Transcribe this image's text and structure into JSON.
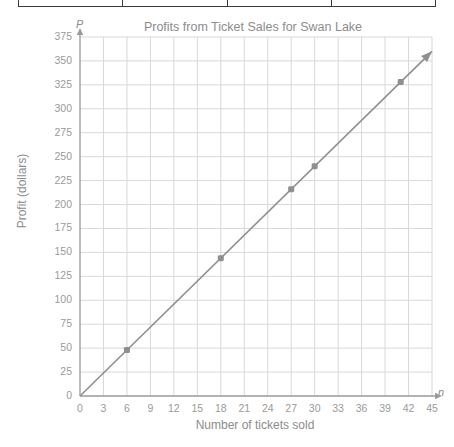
{
  "table_strip": {
    "cells": [
      "",
      "",
      "",
      ""
    ]
  },
  "chart_data": {
    "type": "line",
    "title": "Profits from Ticket Sales for Swan Lake",
    "xlabel": "Number of tickets sold",
    "ylabel": "Profit (dollars)",
    "x_variable": "n",
    "y_variable": "P",
    "xlim": [
      0,
      45
    ],
    "ylim": [
      0,
      375
    ],
    "xticks": [
      0,
      3,
      6,
      9,
      12,
      15,
      18,
      21,
      24,
      27,
      30,
      33,
      36,
      39,
      42,
      45
    ],
    "yticks": [
      0,
      25,
      50,
      75,
      100,
      125,
      150,
      175,
      200,
      225,
      250,
      275,
      300,
      325,
      350,
      375
    ],
    "grid": true,
    "legend": null,
    "line_color": "#8f8f8f",
    "marker_color": "#8f8f8f",
    "grid_color": "#d8d8d8",
    "axis_color": "#9a9a9a",
    "text_color": "#8c8c8c",
    "series": [
      {
        "name": "Profit",
        "relation": "P = 8n",
        "arrow_end": true,
        "line_from": [
          0,
          0
        ],
        "line_to": [
          45,
          360
        ],
        "points": [
          {
            "x": 6,
            "y": 48
          },
          {
            "x": 18,
            "y": 144
          },
          {
            "x": 27,
            "y": 216
          },
          {
            "x": 30,
            "y": 240
          },
          {
            "x": 41,
            "y": 328
          }
        ]
      }
    ]
  }
}
